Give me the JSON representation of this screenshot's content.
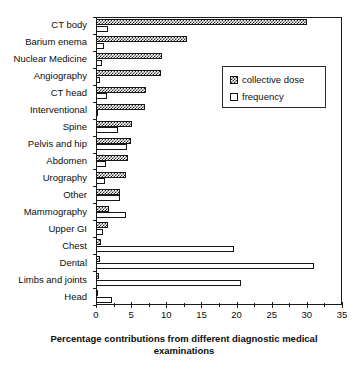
{
  "top_caption": "",
  "chart_data": {
    "type": "bar",
    "orientation": "horizontal",
    "title": "",
    "xlabel": "Percentage contributions from different diagnostic medical examinations",
    "ylabel": "",
    "xlim": [
      0,
      35
    ],
    "xticks": [
      0,
      5,
      10,
      15,
      20,
      25,
      30,
      35
    ],
    "xtick_labels": [
      "0",
      "5",
      "10",
      "15",
      "20",
      "25",
      "30",
      "35"
    ],
    "grid": false,
    "legend_position": "upper right",
    "categories": [
      "CT body",
      "Barium enema",
      "Nuclear Medicine",
      "Angiography",
      "CT head",
      "Interventional",
      "Spine",
      "Pelvis and hip",
      "Abdomen",
      "Urography",
      "Other",
      "Mammography",
      "Upper GI",
      "Chest",
      "Dental",
      "Limbs and joints",
      "Head"
    ],
    "series": [
      {
        "name": "collective dose",
        "pattern": "checkered",
        "values": [
          30.0,
          12.9,
          9.4,
          9.3,
          7.1,
          7.0,
          5.1,
          5.0,
          4.6,
          4.2,
          3.4,
          1.8,
          1.7,
          0.7,
          0.6,
          0.4,
          0.2
        ]
      },
      {
        "name": "frequency",
        "pattern": "empty",
        "values": [
          1.7,
          1.1,
          0.9,
          0.6,
          1.6,
          0.3,
          3.2,
          4.4,
          1.4,
          1.3,
          3.4,
          4.3,
          1.0,
          19.6,
          31.0,
          20.6,
          2.3
        ]
      }
    ],
    "legend": [
      "collective dose",
      "frequency"
    ]
  }
}
